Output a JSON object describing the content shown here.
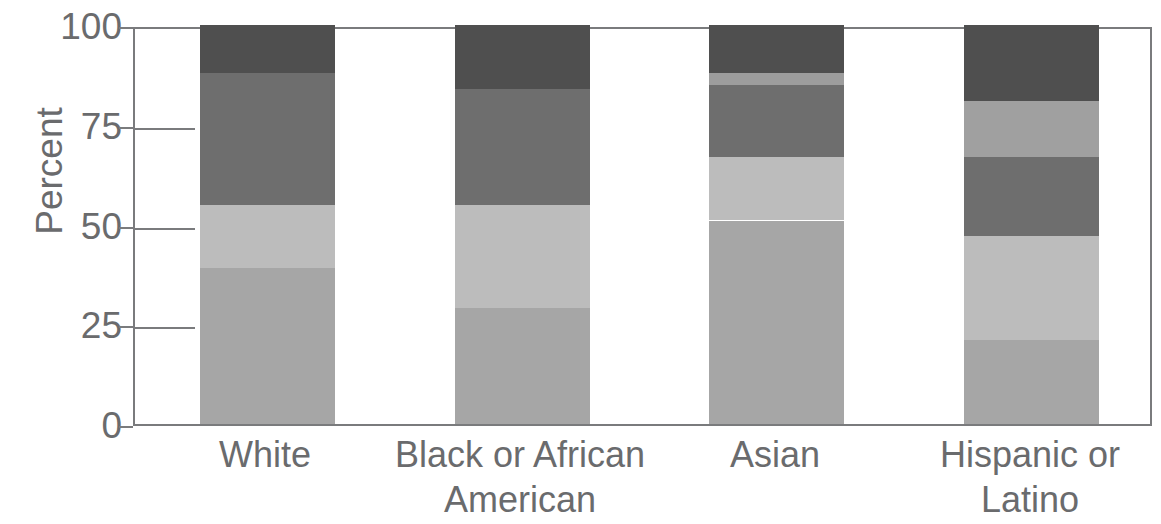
{
  "chart_data": {
    "type": "bar",
    "subtype": "stacked-bar-100",
    "title": "",
    "xlabel": "",
    "ylabel": "Percent",
    "ylim": [
      0,
      100
    ],
    "yticks": [
      0,
      25,
      50,
      75,
      100
    ],
    "ytick_labels": [
      "0",
      "25",
      "50",
      "75",
      "100"
    ],
    "grid": true,
    "legend": "none",
    "categories": [
      "White",
      "Black or African American",
      "Asian",
      "Hispanic or Latino"
    ],
    "category_lines": [
      [
        "White"
      ],
      [
        "Black or African",
        "American"
      ],
      [
        "Asian"
      ],
      [
        "Hispanic or",
        "Latino"
      ]
    ],
    "series": [
      {
        "name": "Segment 1",
        "color": "#a6a6a6",
        "values": [
          39,
          29,
          51,
          21
        ]
      },
      {
        "name": "Segment 2",
        "color": "#bdbdbd",
        "values": [
          16,
          26,
          16,
          26
        ]
      },
      {
        "name": "Segment 3",
        "color": "#6e6e6e",
        "values": [
          33,
          29,
          18,
          20
        ]
      },
      {
        "name": "Segment 4",
        "color": "#a0a0a0",
        "values": [
          0,
          0,
          3,
          14
        ]
      },
      {
        "name": "Segment 5",
        "color": "#4f4f4f",
        "values": [
          12,
          16,
          12,
          19
        ]
      }
    ],
    "stacks": [
      {
        "category": "White",
        "segments": [
          {
            "from": 0,
            "to": 39,
            "value": 39,
            "color": "#a6a6a6"
          },
          {
            "from": 39,
            "to": 55,
            "value": 16,
            "color": "#bcbcbc"
          },
          {
            "from": 55,
            "to": 88,
            "value": 33,
            "color": "#6e6e6e"
          },
          {
            "from": 88,
            "to": 100,
            "value": 12,
            "color": "#4f4f4f"
          }
        ]
      },
      {
        "category": "Black or African American",
        "segments": [
          {
            "from": 0,
            "to": 29,
            "value": 29,
            "color": "#a6a6a6"
          },
          {
            "from": 29,
            "to": 55,
            "value": 26,
            "color": "#bcbcbc"
          },
          {
            "from": 55,
            "to": 84,
            "value": 29,
            "color": "#6e6e6e"
          },
          {
            "from": 84,
            "to": 100,
            "value": 16,
            "color": "#4f4f4f"
          }
        ]
      },
      {
        "category": "Asian",
        "segments": [
          {
            "from": 0,
            "to": 51,
            "value": 51,
            "color": "#a6a6a6"
          },
          {
            "from": 51,
            "to": 67,
            "value": 16,
            "color": "#bcbcbc"
          },
          {
            "from": 67,
            "to": 85,
            "value": 18,
            "color": "#6e6e6e"
          },
          {
            "from": 85,
            "to": 88,
            "value": 3,
            "color": "#9d9d9d"
          },
          {
            "from": 88,
            "to": 100,
            "value": 12,
            "color": "#4f4f4f"
          }
        ]
      },
      {
        "category": "Hispanic or Latino",
        "segments": [
          {
            "from": 0,
            "to": 21,
            "value": 21,
            "color": "#a6a6a6"
          },
          {
            "from": 21,
            "to": 47,
            "value": 26,
            "color": "#bcbcbc"
          },
          {
            "from": 47,
            "to": 67,
            "value": 20,
            "color": "#6e6e6e"
          },
          {
            "from": 67,
            "to": 81,
            "value": 14,
            "color": "#a0a0a0"
          },
          {
            "from": 81,
            "to": 100,
            "value": 19,
            "color": "#4f4f4f"
          }
        ]
      }
    ]
  },
  "axis": {
    "y_title": "Percent"
  }
}
